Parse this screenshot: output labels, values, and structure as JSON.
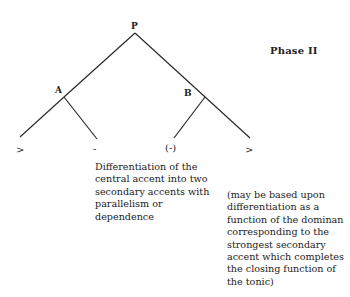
{
  "diagram": {
    "title": "Phase II",
    "root": {
      "label": "P"
    },
    "nodes": [
      {
        "id": "A",
        "label": "A"
      },
      {
        "id": "B",
        "label": "B"
      }
    ],
    "leaves": [
      {
        "parent": "A",
        "label": ">"
      },
      {
        "parent": "A",
        "label": "-"
      },
      {
        "parent": "B",
        "label": "(-)"
      },
      {
        "parent": "B",
        "label": ">"
      }
    ],
    "notes": {
      "left": "Differentiation of the\ncentral accent into two\nsecondary accents with\nparallelism or\ndependence",
      "right": "(may be based upon\ndifferentiation as a\nfunction of the dominan\ncorresponding to the\nstrongest secondary\naccent which completes\nthe closing function of\nthe tonic)"
    }
  }
}
